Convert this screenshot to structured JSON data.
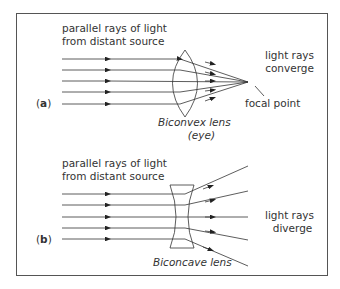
{
  "panel_a": {
    "label_letter": "a",
    "source_line1": "parallel rays of light",
    "source_line2": "from distant source",
    "result_line1": "light rays",
    "result_line2": "converge",
    "focal_label": "focal point",
    "lens_line1": "Biconvex lens",
    "lens_line2": "(eye)"
  },
  "panel_b": {
    "label_letter": "b",
    "source_line1": "parallel rays of light",
    "source_line2": "from distant source",
    "result_line1": "light rays",
    "result_line2": "diverge",
    "lens_label": "Biconcave lens"
  },
  "colors": {
    "line": "#333333",
    "frame": "#555555"
  }
}
